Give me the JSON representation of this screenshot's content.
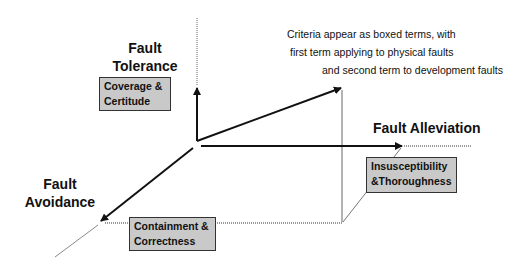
{
  "diagram": {
    "axes": {
      "tolerance": {
        "line1": "Fault",
        "line2": "Tolerance"
      },
      "alleviation": {
        "label": "Fault Alleviation"
      },
      "avoidance": {
        "line1": "Fault",
        "line2": "Avoidance"
      }
    },
    "criteria": {
      "tolerance": {
        "line1": "Coverage &",
        "line2": "Certitude"
      },
      "alleviation": {
        "line1": "Insusceptibility",
        "line2": "&Thoroughness"
      },
      "avoidance": {
        "line1": "Containment &",
        "line2": "Correctness"
      }
    },
    "note": {
      "line1": "Criteria appear as boxed terms, with",
      "line2": "first term applying to physical faults",
      "line3": "and second term to development faults"
    },
    "colors": {
      "box_fill": "#c9c9c9",
      "box_border": "#333333",
      "axis": "#111111",
      "guide": "#888888"
    }
  }
}
